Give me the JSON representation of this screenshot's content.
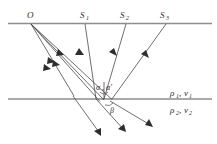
{
  "figure": {
    "kind": "seismic-reflection-refraction-raypath-diagram",
    "background_color": "#ffffff",
    "line_color": "#8d8d8d",
    "ray_color": "#4a4a4a",
    "text_color": "#2b2b2b"
  },
  "labels": {
    "source": "O",
    "geophone_1": "S",
    "geophone_1_sub": "1",
    "geophone_2": "S",
    "geophone_2_sub": "2",
    "geophone_3": "S",
    "geophone_3_sub": "3",
    "angle_incidence": "α",
    "angle_reflection": "α′",
    "angle_refraction": "β",
    "layer1_density": "ρ",
    "layer1_density_sub": "1",
    "layer1_velocity": "v",
    "layer1_velocity_sub": "1",
    "layer1_separator": ",",
    "layer2_density": "ρ",
    "layer2_density_sub": "2",
    "layer2_velocity": "v",
    "layer2_velocity_sub": "2",
    "layer2_separator": ","
  },
  "geometry": {
    "surface_line_y": 23.5,
    "interface_line_y": 99.0,
    "source_point": [
      31,
      23.5
    ],
    "geophone_points": [
      [
        85,
        23.5
      ],
      [
        126,
        23.5
      ],
      [
        166,
        23.5
      ]
    ],
    "reflection_points": [
      [
        96,
        99
      ],
      [
        104,
        99
      ],
      [
        112,
        99
      ]
    ],
    "surface_x_range": [
      8,
      212
    ],
    "interface_x_range": [
      8,
      212
    ]
  },
  "rays": {
    "downgoing_count": 4,
    "upgoing_count": 3,
    "transmitted_count": 3
  }
}
